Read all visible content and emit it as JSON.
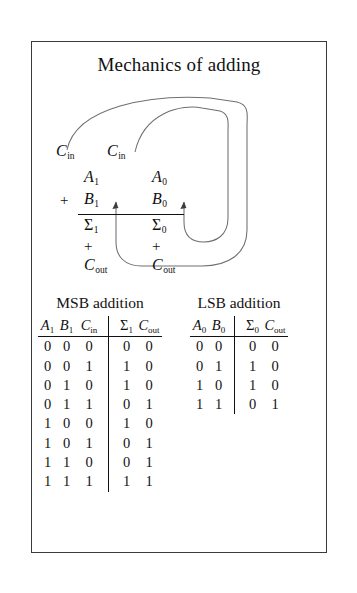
{
  "figure": {
    "title": "Mechanics of adding",
    "border_color": "#3a3a3a",
    "background_color": "#ffffff",
    "text_color": "#111111"
  },
  "mechanics": {
    "carry_in_msb": "C",
    "carry_in_msb_sub": "in",
    "carry_in_lsb": "C",
    "carry_in_lsb_sub": "in",
    "operand_a_msb": "A",
    "operand_a_msb_sub": "1",
    "operand_a_lsb": "A",
    "operand_a_lsb_sub": "0",
    "operand_b_msb": "B",
    "operand_b_msb_sub": "1",
    "operand_b_lsb": "B",
    "operand_b_lsb_sub": "0",
    "plus_sign": "+",
    "sum_msb": "Σ",
    "sum_msb_sub": "1",
    "sum_lsb": "Σ",
    "sum_lsb_sub": "0",
    "carry_plus_msb": "+",
    "carry_plus_lsb": "+",
    "carry_out_msb": "C",
    "carry_out_msb_sub": "out",
    "carry_out_lsb": "C",
    "carry_out_lsb_sub": "out"
  },
  "msb_table": {
    "caption": "MSB addition",
    "headers": [
      {
        "symbol": "A",
        "sub": "1"
      },
      {
        "symbol": "B",
        "sub": "1"
      },
      {
        "symbol": "C",
        "sub": "in"
      },
      {
        "symbol": "Σ",
        "sub": "1"
      },
      {
        "symbol": "C",
        "sub": "out"
      }
    ],
    "rows": [
      [
        "0",
        "0",
        "0",
        "0",
        "0"
      ],
      [
        "0",
        "0",
        "1",
        "1",
        "0"
      ],
      [
        "0",
        "1",
        "0",
        "1",
        "0"
      ],
      [
        "0",
        "1",
        "1",
        "0",
        "1"
      ],
      [
        "1",
        "0",
        "0",
        "1",
        "0"
      ],
      [
        "1",
        "0",
        "1",
        "0",
        "1"
      ],
      [
        "1",
        "1",
        "0",
        "0",
        "1"
      ],
      [
        "1",
        "1",
        "1",
        "1",
        "1"
      ]
    ]
  },
  "lsb_table": {
    "caption": "LSB addition",
    "headers": [
      {
        "symbol": "A",
        "sub": "0"
      },
      {
        "symbol": "B",
        "sub": "0"
      },
      {
        "symbol": "Σ",
        "sub": "0"
      },
      {
        "symbol": "C",
        "sub": "out"
      }
    ],
    "rows": [
      [
        "0",
        "0",
        "0",
        "0"
      ],
      [
        "0",
        "1",
        "1",
        "0"
      ],
      [
        "1",
        "0",
        "1",
        "0"
      ],
      [
        "1",
        "1",
        "0",
        "1"
      ]
    ]
  }
}
